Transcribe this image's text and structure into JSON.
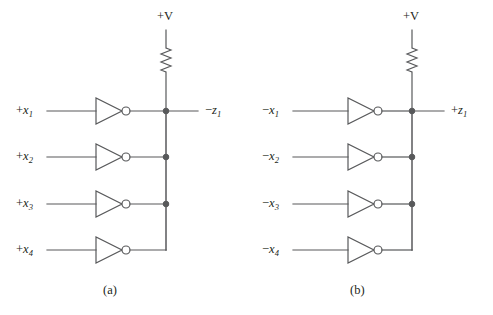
{
  "figure": {
    "background_color": "#ffffff",
    "line_color": "#58595b",
    "text_color": "#231f20",
    "width": 493,
    "height": 315
  },
  "circuits": [
    {
      "id": "a",
      "caption": "(a)",
      "supply_label": "+V",
      "resistor_name": "pull-up-resistor",
      "bubble_side": "output",
      "output": {
        "sign": "−",
        "var": "z",
        "sub": "1"
      },
      "inputs": [
        {
          "sign": "+",
          "var": "x",
          "sub": "1",
          "junction": true
        },
        {
          "sign": "+",
          "var": "x",
          "sub": "2",
          "junction": true
        },
        {
          "sign": "+",
          "var": "x",
          "sub": "3",
          "junction": true
        },
        {
          "sign": "+",
          "var": "x",
          "sub": "4",
          "junction": false
        }
      ]
    },
    {
      "id": "b",
      "caption": "(b)",
      "supply_label": "+V",
      "resistor_name": "pull-up-resistor",
      "bubble_side": "input",
      "output": {
        "sign": "+",
        "var": "z",
        "sub": "1"
      },
      "inputs": [
        {
          "sign": "−",
          "var": "x",
          "sub": "1",
          "junction": true
        },
        {
          "sign": "−",
          "var": "x",
          "sub": "2",
          "junction": true
        },
        {
          "sign": "−",
          "var": "x",
          "sub": "3",
          "junction": true
        },
        {
          "sign": "−",
          "var": "x",
          "sub": "4",
          "junction": false
        }
      ]
    }
  ],
  "geometry": {
    "row_y": [
      111,
      157,
      204,
      250
    ],
    "panels": [
      {
        "id": "a",
        "bus_x": 166,
        "lead_start_x": 47,
        "gate_left_x": 96,
        "gate_right_x": 122,
        "gate_half_h": 13,
        "bubble_r": 4,
        "out_line_end_x": 198,
        "supply_top_y": 30,
        "res_top_y": 48,
        "res_bot_y": 72,
        "supply_label_x": 157,
        "supply_label_y": 9,
        "caption_x": 103,
        "caption_y": 283,
        "out_label_x": 205,
        "out_label_y": 104,
        "in_label_x": 16
      },
      {
        "id": "b",
        "bus_x": 412,
        "lead_start_x": 293,
        "gate_left_x": 348,
        "gate_right_x": 374,
        "gate_half_h": 13,
        "bubble_r": 4,
        "out_line_end_x": 444,
        "supply_top_y": 30,
        "res_top_y": 48,
        "res_bot_y": 72,
        "supply_label_x": 403,
        "supply_label_y": 9,
        "caption_x": 350,
        "caption_y": 283,
        "out_label_x": 451,
        "out_label_y": 104,
        "in_label_x": 262
      }
    ]
  }
}
